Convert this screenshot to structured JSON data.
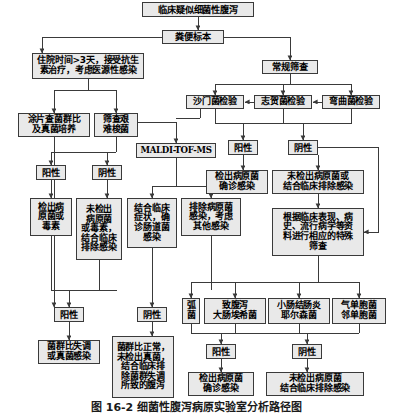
{
  "figure": {
    "caption": "图 16-2  细菌性腹泻病原实验室分析路径图",
    "title_node": "临床疑似细菌性腹泻",
    "line_color": "#3a3a3a",
    "box_fill": "#e9e9e9",
    "box_border": "#3a3a3a",
    "background": "#ffffff"
  },
  "nodes": [
    {
      "id": "n1",
      "label": "临床疑似细菌性腹泻",
      "x": 142,
      "y": 2,
      "w": 112,
      "h": 15,
      "fs": 9.2
    },
    {
      "id": "n2",
      "label": "粪便标本",
      "x": 162,
      "y": 30,
      "w": 62,
      "h": 14,
      "fs": 9.2
    },
    {
      "id": "n3",
      "label": "住院时间>3天，接受抗生\n素治疗，考虑医源性感染",
      "x": 32,
      "y": 53,
      "w": 112,
      "h": 26,
      "fs": 9.0
    },
    {
      "id": "n4",
      "label": "常规筛查",
      "x": 262,
      "y": 60,
      "w": 56,
      "h": 14,
      "fs": 9.2
    },
    {
      "id": "n5",
      "label": "涂片查菌群比\n及真菌培养",
      "x": 18,
      "y": 113,
      "w": 72,
      "h": 24,
      "fs": 9.0
    },
    {
      "id": "n6",
      "label": "筛查艰\n难梭菌",
      "x": 94,
      "y": 113,
      "w": 44,
      "h": 24,
      "fs": 9.0
    },
    {
      "id": "n7",
      "label": "沙门菌检验",
      "x": 186,
      "y": 95,
      "w": 58,
      "h": 14,
      "fs": 9.0
    },
    {
      "id": "n8",
      "label": "志贺菌检验",
      "x": 254,
      "y": 95,
      "w": 58,
      "h": 14,
      "fs": 9.0
    },
    {
      "id": "n9",
      "label": "弯曲菌检验",
      "x": 322,
      "y": 95,
      "w": 58,
      "h": 14,
      "fs": 9.0
    },
    {
      "id": "n10",
      "label": "MALDI-TOF-MS",
      "x": 136,
      "y": 143,
      "w": 80,
      "h": 15,
      "fs": 8.6,
      "mono": true
    },
    {
      "id": "n11",
      "label": "阳性",
      "x": 36,
      "y": 165,
      "w": 30,
      "h": 15,
      "fs": 9.2
    },
    {
      "id": "n12",
      "label": "阴性",
      "x": 92,
      "y": 165,
      "w": 30,
      "h": 15,
      "fs": 9.2
    },
    {
      "id": "n13",
      "label": "阳性",
      "x": 228,
      "y": 140,
      "w": 30,
      "h": 15,
      "fs": 9.2
    },
    {
      "id": "n14",
      "label": "阴性",
      "x": 288,
      "y": 140,
      "w": 30,
      "h": 15,
      "fs": 9.2
    },
    {
      "id": "n15",
      "label": "检出病\n原菌或\n毒素",
      "x": 30,
      "y": 198,
      "w": 42,
      "h": 38,
      "fs": 9.0
    },
    {
      "id": "n16",
      "label": "未检出\n病原菌\n或毒素，\n结合临床\n排除感染",
      "x": 76,
      "y": 198,
      "w": 46,
      "h": 62,
      "fs": 9.0
    },
    {
      "id": "n17",
      "label": "结合临床\n症状，确\n诊肠道菌\n感染",
      "x": 127,
      "y": 198,
      "w": 50,
      "h": 50,
      "fs": 9.0
    },
    {
      "id": "n18",
      "label": "排除病原菌\n感染，考虑\n其他感染",
      "x": 181,
      "y": 198,
      "w": 60,
      "h": 38,
      "fs": 9.0
    },
    {
      "id": "n19",
      "label": "检出病原菌\n确诊感染",
      "x": 206,
      "y": 170,
      "w": 62,
      "h": 24,
      "fs": 9.0
    },
    {
      "id": "n20",
      "label": "未检出病原菌或\n结合临床排除感染",
      "x": 272,
      "y": 170,
      "w": 92,
      "h": 24,
      "fs": 9.0
    },
    {
      "id": "n21",
      "label": "根据临床表现、病\n史、流行病学等资\n料进行相应的特殊\n筛查",
      "x": 272,
      "y": 208,
      "w": 92,
      "h": 48,
      "fs": 9.0
    },
    {
      "id": "n22",
      "label": "弧\n菌",
      "x": 182,
      "y": 298,
      "w": 18,
      "h": 26,
      "fs": 9.0
    },
    {
      "id": "n23",
      "label": "致腹泻\n大肠埃希菌",
      "x": 204,
      "y": 298,
      "w": 62,
      "h": 26,
      "fs": 9.0
    },
    {
      "id": "n24",
      "label": "小肠结肠炎\n耶尔森菌",
      "x": 268,
      "y": 298,
      "w": 62,
      "h": 26,
      "fs": 9.0
    },
    {
      "id": "n25",
      "label": "气单胞菌\n邻单胞菌",
      "x": 332,
      "y": 298,
      "w": 54,
      "h": 26,
      "fs": 9.0
    },
    {
      "id": "n26",
      "label": "阳性",
      "x": 54,
      "y": 307,
      "w": 30,
      "h": 15,
      "fs": 9.2
    },
    {
      "id": "n27",
      "label": "阴性",
      "x": 137,
      "y": 307,
      "w": 30,
      "h": 15,
      "fs": 9.2
    },
    {
      "id": "n28",
      "label": "菌群比失调\n或真菌感染",
      "x": 38,
      "y": 340,
      "w": 62,
      "h": 24,
      "fs": 9.0
    },
    {
      "id": "n29",
      "label": "菌群比正常，\n未检出真菌，\n结合临床排\n除菌群失调\n所致的腹泻",
      "x": 112,
      "y": 336,
      "w": 62,
      "h": 62,
      "fs": 9.0
    },
    {
      "id": "n30",
      "label": "阳性",
      "x": 206,
      "y": 344,
      "w": 30,
      "h": 15,
      "fs": 9.2
    },
    {
      "id": "n31",
      "label": "阴性",
      "x": 292,
      "y": 344,
      "w": 30,
      "h": 15,
      "fs": 9.2
    },
    {
      "id": "n32",
      "label": "检出病原菌\n确诊感染",
      "x": 188,
      "y": 372,
      "w": 66,
      "h": 24,
      "fs": 9.0
    },
    {
      "id": "n33",
      "label": "未检出病原菌\n结合临床排除感染",
      "x": 266,
      "y": 372,
      "w": 98,
      "h": 24,
      "fs": 9.0
    }
  ],
  "edges": [
    {
      "name": "title-to-specimen",
      "d": "M198,17 L198,30",
      "arrow": true
    },
    {
      "name": "specimen-split-left",
      "d": "M193,37 L42,37 L42,53",
      "arrow": true
    },
    {
      "name": "specimen-split-right",
      "d": "M224,37 L290,37 L290,60",
      "arrow": true
    },
    {
      "name": "nosocomial-down",
      "d": "M88,79 L88,90",
      "arrow": false
    },
    {
      "name": "nosocomial-to-smear",
      "d": "M88,90 L54,90 L54,113",
      "arrow": true
    },
    {
      "name": "nosocomial-to-cdiff",
      "d": "M88,90 L116,90 L116,113",
      "arrow": true
    },
    {
      "name": "screening-bus",
      "d": "M290,74 L290,84",
      "arrow": false
    },
    {
      "name": "screening-bus-h",
      "d": "M215,84 L351,84",
      "arrow": false
    },
    {
      "name": "screening-to-salmonella",
      "d": "M215,84 L215,95",
      "arrow": true
    },
    {
      "name": "screening-to-shigella",
      "d": "M283,84 L283,95",
      "arrow": true
    },
    {
      "name": "screening-to-campylo",
      "d": "M351,84 L351,95",
      "arrow": true
    },
    {
      "name": "shigella-to-salmonella",
      "d": "M254,102 L245,102",
      "arrow": true
    },
    {
      "name": "campylo-to-shigella",
      "d": "M322,102 L313,102",
      "arrow": true
    },
    {
      "name": "cdiff-to-maldi-h",
      "d": "M138,122 L176,122 L176,135",
      "arrow": false
    },
    {
      "name": "salmonella-down-maldi",
      "d": "M200,109 L200,118",
      "arrow": false
    },
    {
      "name": "salmonella-maldi-h",
      "d": "M176,118 L200,118",
      "arrow": false
    },
    {
      "name": "maldi-in",
      "d": "M176,135 L176,143",
      "arrow": true
    },
    {
      "name": "pathogen-results-bus",
      "d": "M215,109 L215,123 L303,123",
      "arrow": false
    },
    {
      "name": "salmonella-to-bus",
      "d": "M215,109 L215,123",
      "arrow": false
    },
    {
      "name": "shigella-to-bus",
      "d": "M283,109 L283,123",
      "arrow": false
    },
    {
      "name": "campylo-to-bus",
      "d": "M351,109 L351,123 L303,123",
      "arrow": false
    },
    {
      "name": "bus-to-positive",
      "d": "M243,123 L243,140",
      "arrow": true
    },
    {
      "name": "bus-to-negative",
      "d": "M303,123 L303,140",
      "arrow": true
    },
    {
      "name": "positive-to-detected",
      "d": "M243,155 L243,170",
      "arrow": true
    },
    {
      "name": "negative-to-undetected",
      "d": "M318,155 L318,170",
      "arrow": true
    },
    {
      "name": "undetected-to-special",
      "d": "M318,194 L318,208",
      "arrow": true
    },
    {
      "name": "negative-side-to-special",
      "d": "M318,147 L378,147 L378,232 L364,232",
      "arrow": true
    },
    {
      "name": "smear-to-sublevel",
      "d": "M54,137 L54,290 L54,307",
      "arrow": true
    },
    {
      "name": "cdiff-down",
      "d": "M116,137 L116,152",
      "arrow": false
    },
    {
      "name": "cdiff-to-pos",
      "d": "M116,152 L51,152 L51,165",
      "arrow": true
    },
    {
      "name": "cdiff-to-neg",
      "d": "M116,152 L107,152 L107,165",
      "arrow": true
    },
    {
      "name": "cdiff-pos-out",
      "d": "M51,180 L51,198",
      "arrow": true
    },
    {
      "name": "cdiff-neg-out",
      "d": "M107,180 L107,198",
      "arrow": true
    },
    {
      "name": "maldi-down",
      "d": "M176,158 L176,186",
      "arrow": false
    },
    {
      "name": "maldi-to-clinical",
      "d": "M176,186 L152,186 L152,198",
      "arrow": true
    },
    {
      "name": "maldi-to-exclude",
      "d": "M176,186 L211,186 L211,198",
      "arrow": true
    },
    {
      "name": "detected-left-down",
      "d": "M51,236 L51,290 L117,290",
      "arrow": false
    },
    {
      "name": "undetected2-down",
      "d": "M99,260 L99,290",
      "arrow": false
    },
    {
      "name": "clinical-down",
      "d": "M152,248 L152,290",
      "arrow": false
    },
    {
      "name": "exclude-down",
      "d": "M211,236 L211,290",
      "arrow": false
    },
    {
      "name": "lower-bus-to-pos",
      "d": "M69,290 L69,307",
      "arrow": true
    },
    {
      "name": "lower-bus-to-neg",
      "d": "M152,290 L152,307",
      "arrow": true
    },
    {
      "name": "lower-pos-out",
      "d": "M69,322 L69,340",
      "arrow": true
    },
    {
      "name": "lower-neg-out",
      "d": "M152,322 L152,336",
      "arrow": true
    },
    {
      "name": "special-down",
      "d": "M318,256 L318,282",
      "arrow": false
    },
    {
      "name": "special-bus-h",
      "d": "M191,282 L359,282",
      "arrow": false
    },
    {
      "name": "special-to-vibrio",
      "d": "M191,282 L191,298",
      "arrow": true
    },
    {
      "name": "special-to-ecoli",
      "d": "M235,282 L235,298",
      "arrow": true
    },
    {
      "name": "special-to-yersinia",
      "d": "M299,282 L299,298",
      "arrow": true
    },
    {
      "name": "special-to-aeromonas",
      "d": "M359,282 L359,298",
      "arrow": true
    },
    {
      "name": "organisms-bus",
      "d": "M191,324 L191,333 L359,333",
      "arrow": false
    },
    {
      "name": "vibrio-bus",
      "d": "M191,324 L191,333",
      "arrow": false
    },
    {
      "name": "ecoli-bus",
      "d": "M235,324 L235,333",
      "arrow": false
    },
    {
      "name": "yersinia-bus",
      "d": "M299,324 L299,333",
      "arrow": false
    },
    {
      "name": "aeromonas-bus",
      "d": "M359,324 L359,333",
      "arrow": false
    },
    {
      "name": "organisms-to-pos",
      "d": "M221,333 L221,344",
      "arrow": true
    },
    {
      "name": "organisms-to-neg",
      "d": "M307,333 L307,344",
      "arrow": true
    },
    {
      "name": "bottom-pos-out",
      "d": "M221,359 L221,372",
      "arrow": true
    },
    {
      "name": "bottom-neg-out",
      "d": "M307,359 L307,372",
      "arrow": true
    }
  ]
}
